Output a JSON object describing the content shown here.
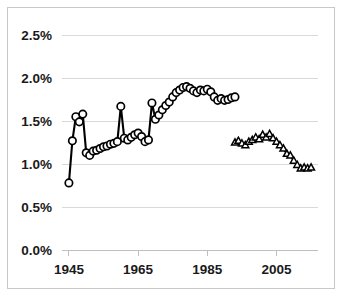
{
  "chart_data": {
    "type": "line",
    "title": "",
    "subtitle": "",
    "xlabel": "",
    "ylabel": "",
    "xlim": [
      1943,
      2017
    ],
    "ylim": [
      0.0,
      2.5
    ],
    "grid": true,
    "legend": "none",
    "y_ticks": [
      "0.0%",
      "0.5%",
      "1.0%",
      "1.5%",
      "2.0%",
      "2.5%"
    ],
    "y_tick_values": [
      0.0,
      0.5,
      1.0,
      1.5,
      2.0,
      2.5
    ],
    "x_ticks": [
      "1945",
      "1965",
      "1985",
      "2005"
    ],
    "x_tick_values": [
      1945,
      1965,
      1985,
      2005
    ],
    "series": [
      {
        "name": "series-circles",
        "marker": "circle",
        "x": [
          1945,
          1946,
          1947,
          1948,
          1949,
          1950,
          1951,
          1952,
          1953,
          1954,
          1955,
          1956,
          1957,
          1958,
          1959,
          1960,
          1961,
          1962,
          1963,
          1964,
          1965,
          1966,
          1967,
          1968,
          1969,
          1970,
          1971,
          1972,
          1973,
          1974,
          1975,
          1976,
          1977,
          1978,
          1979,
          1980,
          1981,
          1982,
          1983,
          1984,
          1985,
          1986,
          1987,
          1988,
          1989,
          1990,
          1991,
          1992,
          1993
        ],
        "values": [
          0.78,
          1.27,
          1.55,
          1.49,
          1.58,
          1.13,
          1.1,
          1.15,
          1.16,
          1.18,
          1.2,
          1.21,
          1.23,
          1.24,
          1.26,
          1.67,
          1.3,
          1.28,
          1.31,
          1.34,
          1.36,
          1.32,
          1.26,
          1.28,
          1.71,
          1.52,
          1.57,
          1.63,
          1.68,
          1.72,
          1.78,
          1.83,
          1.86,
          1.89,
          1.9,
          1.88,
          1.85,
          1.83,
          1.86,
          1.85,
          1.87,
          1.84,
          1.78,
          1.74,
          1.76,
          1.74,
          1.75,
          1.77,
          1.78
        ]
      },
      {
        "name": "series-triangles",
        "marker": "triangle",
        "x": [
          1993,
          1994,
          1995,
          1996,
          1997,
          1998,
          1999,
          2000,
          2001,
          2002,
          2003,
          2004,
          2005,
          2006,
          2007,
          2008,
          2009,
          2010,
          2011,
          2012,
          2013,
          2014,
          2015
        ],
        "values": [
          1.25,
          1.27,
          1.24,
          1.22,
          1.26,
          1.28,
          1.31,
          1.29,
          1.34,
          1.31,
          1.35,
          1.3,
          1.26,
          1.22,
          1.18,
          1.12,
          1.1,
          1.04,
          0.99,
          0.95,
          0.96,
          0.95,
          0.96
        ]
      }
    ]
  },
  "colors": {
    "background": "#ffffff",
    "border": "#c8c8c8",
    "gridline": "#d9d9d9",
    "axis": "#bfbfbf",
    "series_stroke": "#000000",
    "marker_fill": "#ffffff",
    "tick_text": "#1a1a1a"
  }
}
